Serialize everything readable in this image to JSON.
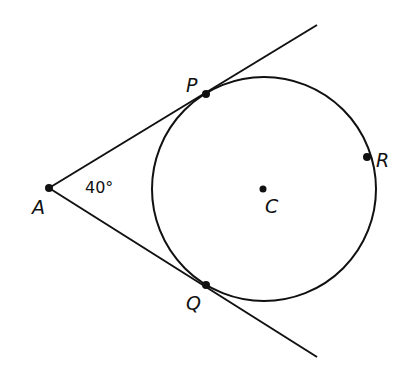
{
  "diagram": {
    "type": "geometry",
    "points": {
      "A": {
        "label": "A",
        "x": 49,
        "y": 188
      },
      "P": {
        "label": "P",
        "x": 206,
        "y": 94
      },
      "Q": {
        "label": "Q",
        "x": 206,
        "y": 285
      },
      "R": {
        "label": "R",
        "x": 367,
        "y": 157
      },
      "C": {
        "label": "C",
        "x": 263,
        "y": 189
      }
    },
    "circle": {
      "center": "C",
      "cx": 264,
      "cy": 189,
      "r": 112
    },
    "angle": {
      "vertex": "A",
      "label": "40°"
    },
    "lines": [
      {
        "from": "A",
        "to": "upper-end",
        "x2": 317,
        "y2": 25
      },
      {
        "from": "A",
        "to": "lower-end",
        "x2": 317,
        "y2": 357
      }
    ],
    "colors": {
      "stroke": "#111111",
      "background": "#ffffff"
    }
  }
}
